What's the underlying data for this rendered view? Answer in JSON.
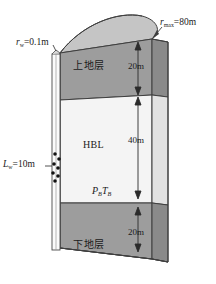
{
  "figure": {
    "labels": {
      "r_w": {
        "symbol": "r",
        "subscript": "w",
        "value": "=0.1m",
        "full": "r_w=0.1m"
      },
      "r_max": {
        "symbol": "r",
        "subscript": "max",
        "value": "=80m",
        "full": "r_max=80m"
      },
      "L_w": {
        "symbol": "L",
        "subscript": "w",
        "value": "=10m",
        "full": "L_w=10m"
      },
      "upper_layer": "上地层",
      "middle_layer": "HBL",
      "lower_layer": "下地层",
      "boundary_condition": {
        "p_symbol": "P",
        "p_sub": "B",
        "t_symbol": "T",
        "t_sub": "B",
        "full": "P_B T_B"
      }
    },
    "dimensions": {
      "upper_thickness": "20m",
      "middle_thickness": "40m",
      "lower_thickness": "20m"
    },
    "colors": {
      "formation_gray": "#9d9d9d",
      "hbl_light": "#f3f3f3",
      "dome_top": "#c9c9c9",
      "outline": "#3a3a3a",
      "perforation": "#111111",
      "background": "#ffffff"
    }
  }
}
